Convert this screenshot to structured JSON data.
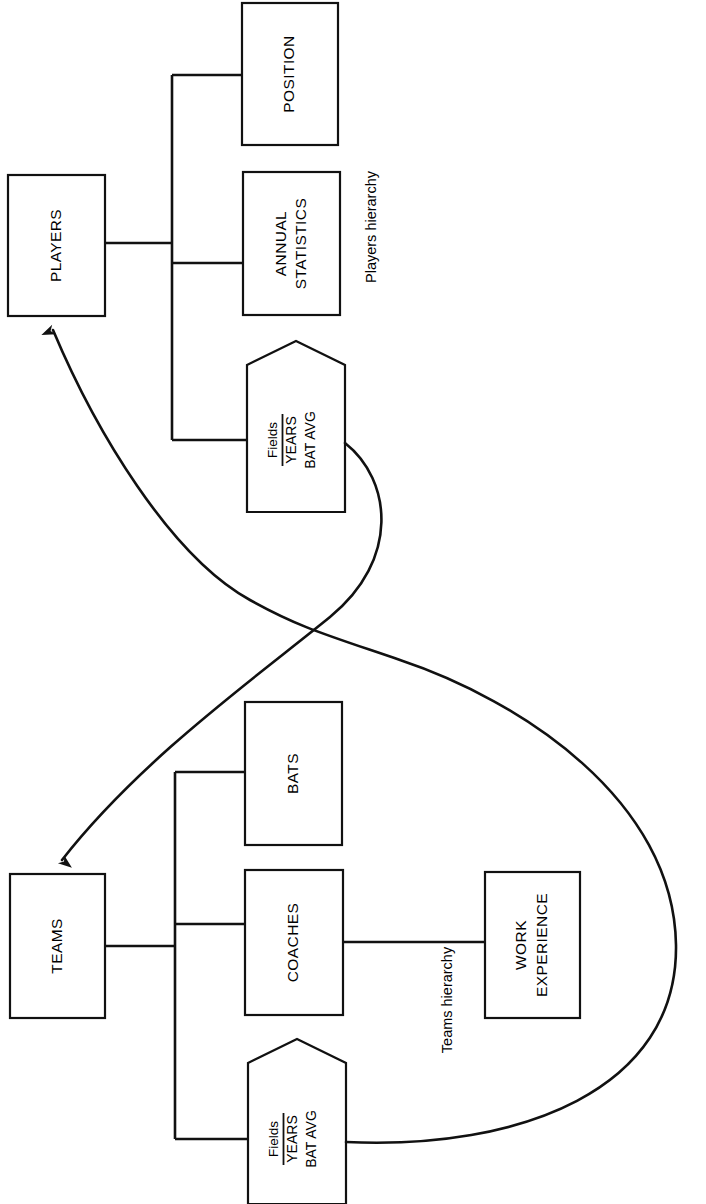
{
  "diagram": {
    "orientation": "rotated-90-ccw",
    "background_color": "#ffffff",
    "line_color": "#111111",
    "captions": {
      "players": "Players hierarchy",
      "teams": "Teams hierarchy"
    },
    "players_hierarchy": {
      "root": {
        "label": "PLAYERS"
      },
      "children": [
        {
          "label": "POSITION",
          "type": "segment"
        },
        {
          "label": "ANNUAL\nSTATISTICS",
          "line1": "ANNUAL",
          "line2": "STATISTICS",
          "type": "segment"
        },
        {
          "type": "fields",
          "header": "Fields",
          "items": [
            "YEARS",
            "BAT AVG"
          ]
        }
      ]
    },
    "teams_hierarchy": {
      "root": {
        "label": "TEAMS"
      },
      "children": [
        {
          "label": "BATS",
          "type": "segment"
        },
        {
          "label": "COACHES",
          "type": "segment",
          "children": [
            {
              "line1": "WORK",
              "line2": "EXPERIENCE",
              "type": "segment"
            }
          ]
        },
        {
          "type": "fields",
          "header": "Fields",
          "items": [
            "YEARS",
            "BAT AVG"
          ]
        }
      ]
    },
    "relationships": [
      {
        "from": "players-fields",
        "to": "TEAMS",
        "style": "curved-arrow"
      },
      {
        "from": "teams-fields",
        "to": "PLAYERS",
        "style": "curved-arrow"
      }
    ]
  },
  "labels": {
    "players_root": "PLAYERS",
    "position": "POSITION",
    "annual_1": "ANNUAL",
    "annual_2": "STATISTICS",
    "players_fields_header": "Fields",
    "players_fields_1": "YEARS",
    "players_fields_2": "BAT AVG",
    "players_caption": "Players hierarchy",
    "teams_root": "TEAMS",
    "bats": "BATS",
    "coaches": "COACHES",
    "work_1": "WORK",
    "work_2": "EXPERIENCE",
    "teams_fields_header": "Fields",
    "teams_fields_1": "YEARS",
    "teams_fields_2": "BAT AVG",
    "teams_caption": "Teams hierarchy"
  }
}
